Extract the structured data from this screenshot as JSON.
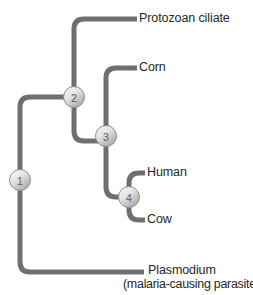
{
  "figure": {
    "type": "cladogram",
    "title": "",
    "background_color": "#ffffff",
    "branch_color": "#6f6f6f",
    "text_color": "#262626",
    "node_fill_light": "#f2f2f2",
    "node_fill_dark": "#b8b8b8",
    "node_stroke": "#8a8a8a"
  },
  "nodes": [
    {
      "id": "1",
      "label": "1",
      "x": 20,
      "y": 180
    },
    {
      "id": "2",
      "label": "2",
      "x": 74,
      "y": 97
    },
    {
      "id": "3",
      "label": "3",
      "x": 106,
      "y": 136
    },
    {
      "id": "4",
      "label": "4",
      "x": 129,
      "y": 197
    }
  ],
  "leaves": [
    {
      "id": "protozoan-ciliate",
      "label": "Protozoan ciliate",
      "sublabel": "",
      "tip_x": 137,
      "tip_y": 19,
      "label_x": 139,
      "label_y": 12
    },
    {
      "id": "corn",
      "label": "Corn",
      "sublabel": "",
      "tip_x": 137,
      "tip_y": 68,
      "label_x": 139,
      "label_y": 61
    },
    {
      "id": "human",
      "label": "Human",
      "sublabel": "",
      "tip_x": 145,
      "tip_y": 173,
      "label_x": 147,
      "label_y": 166
    },
    {
      "id": "cow",
      "label": "Cow",
      "sublabel": "",
      "tip_x": 145,
      "tip_y": 220,
      "label_x": 147,
      "label_y": 213
    },
    {
      "id": "plasmodium",
      "label": "Plasmodium",
      "sublabel": "(malaria-causing parasite)",
      "tip_x": 144,
      "tip_y": 272,
      "label_x": 146,
      "label_y": 264
    }
  ],
  "sublabel_position": {
    "x": 124,
    "y": 278
  },
  "edges": [
    {
      "id": "root-to-node1",
      "from": "root",
      "to": "1"
    },
    {
      "id": "node1-to-node2",
      "from": "1",
      "to": "2"
    },
    {
      "id": "node1-to-plasmodium",
      "from": "1",
      "to": "plasmodium"
    },
    {
      "id": "node2-to-protozoan-ciliate",
      "from": "2",
      "to": "protozoan-ciliate"
    },
    {
      "id": "node2-to-node3",
      "from": "2",
      "to": "3"
    },
    {
      "id": "node3-to-corn",
      "from": "3",
      "to": "corn"
    },
    {
      "id": "node3-to-node4",
      "from": "3",
      "to": "4"
    },
    {
      "id": "node4-to-human",
      "from": "4",
      "to": "human"
    },
    {
      "id": "node4-to-cow",
      "from": "4",
      "to": "cow"
    }
  ]
}
